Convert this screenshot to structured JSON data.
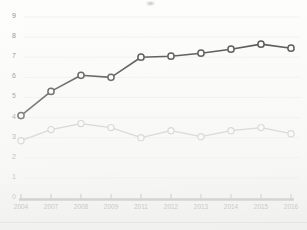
{
  "chart_data": {
    "type": "line",
    "title": "",
    "subtitle": "",
    "xlabel": "",
    "ylabel": "",
    "categories": [
      "2004",
      "2007",
      "2008",
      "2009",
      "2011",
      "2012",
      "2013",
      "2014",
      "2015",
      "2016"
    ],
    "x_tick_labels": [
      "2004",
      "2007",
      "2008",
      "2009",
      "2011",
      "2012",
      "2013",
      "2014",
      "2015",
      "2016"
    ],
    "y_tick_labels": [
      "0",
      "1",
      "2",
      "3",
      "4",
      "5",
      "6",
      "7",
      "8",
      "9"
    ],
    "y_ticks": [
      0,
      1,
      2,
      3,
      4,
      5,
      6,
      7,
      8,
      9
    ],
    "ylim": [
      0,
      9
    ],
    "grid": false,
    "legend": "none",
    "annotations": [],
    "series": [
      {
        "name": "dark-series",
        "color": "#3d3d3d",
        "marker": "open-circle",
        "values": [
          4.1,
          5.3,
          6.1,
          6.0,
          7.0,
          7.05,
          7.2,
          7.4,
          7.65,
          7.45
        ]
      },
      {
        "name": "light-series",
        "color": "#c6c6c6",
        "marker": "open-circle",
        "values": [
          2.85,
          3.4,
          3.7,
          3.5,
          3.0,
          3.35,
          3.05,
          3.35,
          3.5,
          3.2
        ]
      }
    ]
  },
  "axis": {
    "baseline_color": "#9a9a9a",
    "tick_color": "#8f8f8f"
  }
}
